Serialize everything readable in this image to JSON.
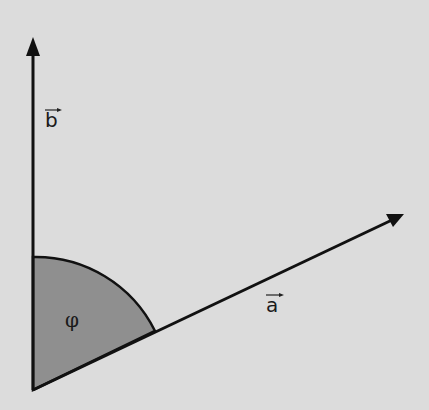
{
  "diagram": {
    "background": "#dcdcdc",
    "sector_color": "#8f8f8f",
    "line_color": "#111111",
    "vectors": [
      {
        "name": "a",
        "label": "a",
        "from": [
          33,
          390
        ],
        "to": [
          403,
          215
        ]
      },
      {
        "name": "b",
        "label": "b",
        "from": [
          33,
          390
        ],
        "to": [
          33,
          38
        ]
      }
    ],
    "angle": {
      "label": "φ",
      "radius": 133
    }
  }
}
